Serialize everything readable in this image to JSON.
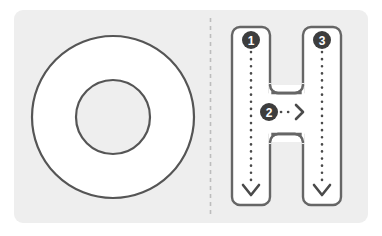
{
  "card": {
    "background_color": "#eeeeee",
    "corner_radius": 9,
    "divider": {
      "name": "dashed-divider",
      "orientation": "vertical",
      "color": "#bdbdbd",
      "dash": "4 4"
    }
  },
  "panels": [
    {
      "id": "left",
      "name": "letter-o-panel",
      "letter": "O",
      "description": "Outlined capital letter O drawn as a ring",
      "fill_color": "#ffffff",
      "stroke_color": "#555555",
      "stroke_width": 2.2,
      "outer_circle": {
        "cx": 113,
        "cy": 117,
        "r": 81
      },
      "inner_circle": {
        "cx": 113,
        "cy": 117,
        "r": 37
      },
      "stroke_guides": []
    },
    {
      "id": "right",
      "name": "letter-h-panel",
      "letter": "H",
      "description": "Outlined capital letter H with numbered stroke-order guides",
      "fill_color": "#ffffff",
      "stroke_color": "#666666",
      "stroke_width": 2.4,
      "guide_color": "#4a4a4a",
      "marker_fill": "#3d3d3d",
      "marker_text_color": "#ffffff",
      "stroke_guides": [
        {
          "order": "1",
          "label": "❶",
          "name": "stroke-guide-1",
          "direction": "down",
          "start": {
            "x": 251,
            "y": 47
          },
          "end": {
            "x": 251,
            "y": 196
          },
          "marker": {
            "x": 251,
            "y": 40,
            "r": 9
          }
        },
        {
          "order": "2",
          "label": "❷",
          "name": "stroke-guide-2",
          "direction": "right",
          "start": {
            "x": 279,
            "y": 112
          },
          "end": {
            "x": 300,
            "y": 112
          },
          "marker": {
            "x": 269,
            "y": 112,
            "r": 9
          }
        },
        {
          "order": "3",
          "label": "❸",
          "name": "stroke-guide-3",
          "direction": "down",
          "start": {
            "x": 322,
            "y": 47
          },
          "end": {
            "x": 322,
            "y": 196
          },
          "marker": {
            "x": 322,
            "y": 40,
            "r": 9
          }
        }
      ]
    }
  ]
}
